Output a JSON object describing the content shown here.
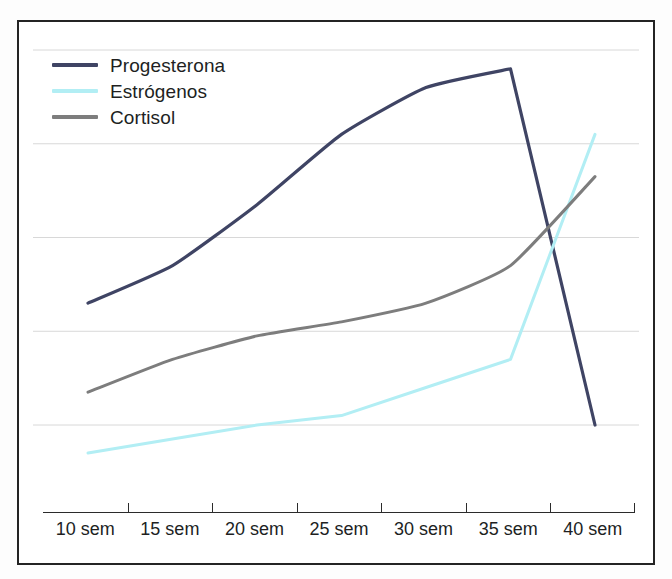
{
  "chart_data": {
    "type": "line",
    "title": "",
    "xlabel": "",
    "ylabel": "",
    "categories": [
      "10 sem",
      "15 sem",
      "20 sem",
      "25 sem",
      "30 sem",
      "35 sem",
      "40 sem"
    ],
    "x": [
      10,
      15,
      20,
      25,
      30,
      35,
      40
    ],
    "xlim": [
      10,
      40
    ],
    "ylim": [
      0,
      100
    ],
    "grid": true,
    "gridlines_y": [
      80,
      60,
      40,
      20,
      0
    ],
    "legend_position": "top-left",
    "series": [
      {
        "name": "Progesterona",
        "color": "#3f4464",
        "values": [
          26,
          34,
          47,
          62,
          72,
          76,
          0
        ]
      },
      {
        "name": "Estrógenos",
        "color": "#b2eef4",
        "values": [
          -6,
          -3,
          0,
          2,
          8,
          14,
          62
        ]
      },
      {
        "name": "Cortisol",
        "color": "#7d7d7d",
        "values": [
          7,
          14,
          19,
          22,
          26,
          34,
          53
        ]
      }
    ]
  },
  "legend": {
    "items": [
      {
        "label": "Progesterona",
        "color": "#3f4464",
        "swatch": "line-swatch"
      },
      {
        "label": "Estrógenos",
        "color": "#b2eef4",
        "swatch": "line-swatch"
      },
      {
        "label": "Cortisol",
        "color": "#7d7d7d",
        "swatch": "line-swatch"
      }
    ]
  },
  "axis": {
    "labels": [
      "10 sem",
      "15 sem",
      "20 sem",
      "25 sem",
      "30 sem",
      "35 sem",
      "40 sem"
    ]
  },
  "style": {
    "border_color": "#242424",
    "grid_color": "#d8d8d8",
    "background": "#ffffff",
    "text_color": "#211f1f"
  }
}
